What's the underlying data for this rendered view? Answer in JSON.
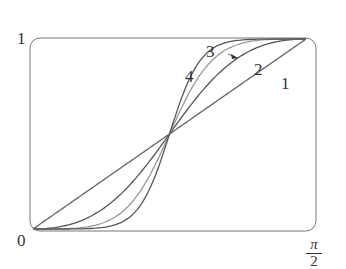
{
  "chart_data": {
    "type": "line",
    "title": "",
    "xlabel": "",
    "ylabel": "",
    "xlim": [
      0,
      1.5708
    ],
    "ylim": [
      0,
      1
    ],
    "x_tick_labels": [
      "0",
      "π/2"
    ],
    "y_tick_labels": [
      "0",
      "1"
    ],
    "grid": false,
    "series": [
      {
        "name": "1",
        "label": "1",
        "color": "#666666",
        "shape": "linear from (0,0) to (π/2,1)"
      },
      {
        "name": "2",
        "label": "2",
        "color": "#555555",
        "shape": "s-curve through (π/4,0.5)"
      },
      {
        "name": "3",
        "label": "3",
        "color": "#999999",
        "shape": "steeper s-curve through (π/4,0.5)"
      },
      {
        "name": "4",
        "label": "4",
        "color": "#555555",
        "shape": "steepest s-curve through (π/4,0.5)"
      }
    ],
    "annotations": [
      "all curves intersect at (π/4, 0.5)",
      "arrow from label 3 to curve 3"
    ]
  },
  "labels": {
    "y_top": "1",
    "origin": "0",
    "x_num": "π",
    "x_den": "2",
    "c1": "1",
    "c2": "2",
    "c3": "3",
    "c4": "4"
  }
}
